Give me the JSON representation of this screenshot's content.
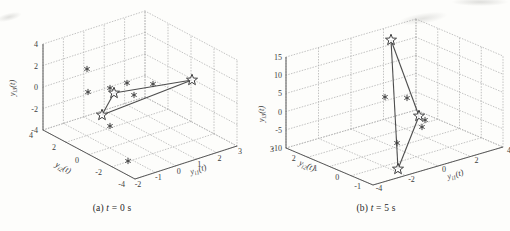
{
  "figure": {
    "colors": {
      "background": "#fdfdfb",
      "grid": "#b4b4b4",
      "axis": "#5a5a5a",
      "tick_text": "#3c3c3c",
      "title_text": "#3c3c3c",
      "marker": "#404040",
      "edge_line": "#4d4d4d",
      "caption_text": "#1f1f1f"
    },
    "captions": {
      "a": {
        "prefix": "(a) ",
        "var": "t",
        "rest": " = 0 s"
      },
      "b": {
        "prefix": "(b) ",
        "var": "t",
        "rest": " = 5 s"
      }
    }
  },
  "chart_data": [
    {
      "type": "scatter",
      "projection": "3d",
      "caption": "(a) t = 0 s",
      "grid": true,
      "axes": {
        "x": {
          "title": "y_{i1}(t)",
          "tick_labels": [
            "-2",
            "-1",
            "0",
            "1",
            "2",
            "3"
          ],
          "range": [
            -2,
            3
          ]
        },
        "y": {
          "title": "y_{i2}(t)",
          "tick_labels": [
            "4",
            "2",
            "0",
            "-2",
            "-4"
          ],
          "range": [
            -4,
            4
          ]
        },
        "z": {
          "title": "y_{i3}(t)",
          "tick_labels": [
            "-4",
            "-2",
            "0",
            "2",
            "4"
          ],
          "range": [
            -4,
            4
          ]
        }
      },
      "series": [
        {
          "name": "follower-outputs",
          "marker": "asterisk",
          "points_px": [
            [
              87,
              69
            ],
            [
              88,
              92
            ],
            [
              110,
              88
            ],
            [
              127,
              83
            ],
            [
              134,
              95
            ],
            [
              153,
              84
            ],
            [
              110,
              126
            ],
            [
              128,
              161
            ]
          ]
        },
        {
          "name": "formation-vertices",
          "marker": "pentagram",
          "points_px": [
            [
              114,
              93
            ],
            [
              102,
              115
            ],
            [
              192,
              80
            ]
          ],
          "edges": [
            [
              0,
              1
            ],
            [
              0,
              2
            ],
            [
              1,
              2
            ]
          ]
        }
      ],
      "layout": {
        "frame": {
          "O": [
            43,
            130
          ],
          "Vx": [
            102,
            -33
          ],
          "Vy": [
            92,
            49
          ],
          "Vz": [
            0,
            -86
          ]
        },
        "tick_label_style": {
          "z": {
            "offset": [
              -5,
              3
            ],
            "anchor": "end"
          },
          "y": {
            "offset": [
              -10,
              8
            ],
            "anchor": "end"
          },
          "x": {
            "offset": [
              3,
              8
            ],
            "anchor": "middle"
          }
        },
        "titles": {
          "z": {
            "pos": [
              15,
              88
            ],
            "rotate": -90
          },
          "y": {
            "pos": [
              62,
              170
            ],
            "rotate": 28
          },
          "x": {
            "pos": [
              199,
              172
            ],
            "rotate": -17
          }
        }
      }
    },
    {
      "type": "scatter",
      "projection": "3d",
      "caption": "(b) t = 5 s",
      "grid": true,
      "axes": {
        "x": {
          "title": "y_{i1}(t)",
          "tick_labels": [
            "-4",
            "-2",
            "0",
            "2",
            "4"
          ],
          "range": [
            -4,
            4
          ]
        },
        "y": {
          "title": "y_{i2}(t)",
          "tick_labels": [
            "3",
            "2",
            "1",
            "0",
            "-1"
          ],
          "range": [
            -1,
            3
          ]
        },
        "z": {
          "title": "y_{i3}(t)",
          "tick_labels": [
            "-10",
            "-5",
            "0",
            "5",
            "10",
            "15"
          ],
          "range": [
            -10,
            15
          ]
        }
      },
      "series": [
        {
          "name": "follower-outputs",
          "marker": "asterisk",
          "points_px": [
            [
              385,
              97
            ],
            [
              407,
              98
            ],
            [
              425,
              120
            ],
            [
              422,
              127
            ],
            [
              397,
              143
            ]
          ]
        },
        {
          "name": "formation-vertices",
          "marker": "pentagram",
          "points_px": [
            [
              391,
              40
            ],
            [
              419,
              116
            ],
            [
              398,
              169
            ]
          ],
          "edges": [
            [
              0,
              1
            ],
            [
              1,
              2
            ],
            [
              2,
              0
            ]
          ]
        }
      ],
      "layout": {
        "frame": {
          "O": [
            286,
            148
          ],
          "Vx": [
            130,
            -38
          ],
          "Vy": [
            87,
            37
          ],
          "Vz": [
            0,
            -91
          ]
        },
        "tick_label_style": {
          "z": {
            "offset": [
              -4,
              3
            ],
            "anchor": "end"
          },
          "y": {
            "offset": [
              -12,
              4
            ],
            "anchor": "end"
          },
          "x": {
            "offset": [
              6,
              6
            ],
            "anchor": "middle"
          }
        },
        "titles": {
          "z": {
            "pos": [
              264,
              114
            ],
            "rotate": -90
          },
          "y": {
            "pos": [
              306,
              168
            ],
            "rotate": 23
          },
          "x": {
            "pos": [
              456,
              177
            ],
            "rotate": -16
          }
        }
      }
    }
  ]
}
